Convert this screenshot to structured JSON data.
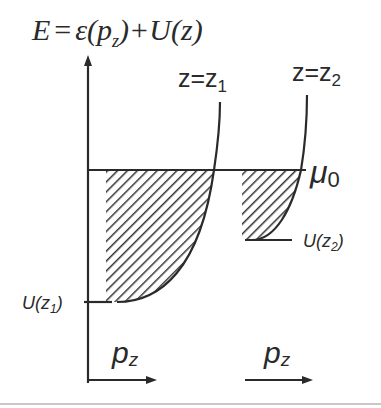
{
  "title_formula": {
    "E": "E",
    "eq": "=",
    "eps": "ε(",
    "p": "p",
    "sub": "z",
    "rest": ")+U(z)"
  },
  "curve_labels": {
    "z1": {
      "main": "z=z",
      "sub": "1"
    },
    "z2": {
      "main": "z=z",
      "sub": "2"
    }
  },
  "levels": {
    "mu0": {
      "main": "μ",
      "sub": "0"
    },
    "U_z1": {
      "main": "U(z",
      "sub": "1",
      "close": ")"
    },
    "U_z2": {
      "main": "U(z",
      "sub": "2",
      "close": ")"
    }
  },
  "axes": {
    "y_label": "E",
    "x_label_1": {
      "main": "p",
      "sub": "z"
    },
    "x_label_2": {
      "main": "p",
      "sub": "z"
    }
  },
  "colors": {
    "ink": "#2a2a2a",
    "hatch": "#333333",
    "background": "#ffffff",
    "bottom_rule": "#c8c8c8"
  }
}
